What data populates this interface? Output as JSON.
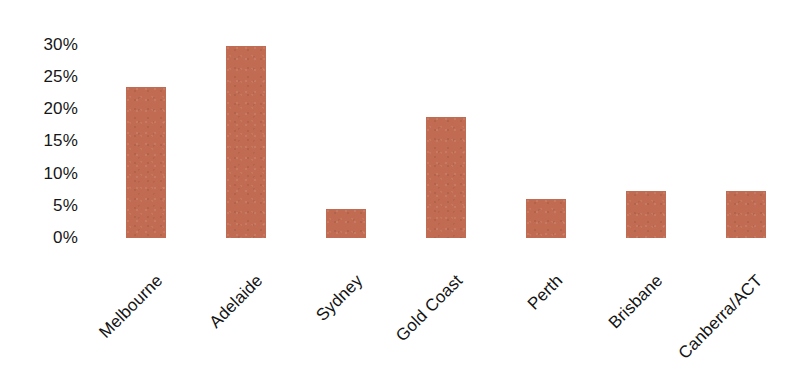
{
  "chart_data": {
    "type": "bar",
    "title": "",
    "subtitle": "",
    "xlabel": "",
    "ylabel": "",
    "categories": [
      "Melbourne",
      "Adelaide",
      "Sydney",
      "Gold Coast",
      "Perth",
      "Brisbane",
      "Canberra/ACT"
    ],
    "values": [
      23.5,
      29.8,
      4.5,
      18.8,
      6.1,
      7.3,
      7.3
    ],
    "value_unit": "%",
    "ylim": [
      0,
      30
    ],
    "y_tick_values": [
      30,
      25,
      20,
      15,
      10,
      5,
      0
    ],
    "y_tick_labels": [
      "30%",
      "25%",
      "20%",
      "15%",
      "10%",
      "5%",
      "0%"
    ],
    "grid": false,
    "axis_line": false,
    "legend": null,
    "legend_position": "none",
    "series": [
      {
        "name": "",
        "values": [
          23.5,
          29.8,
          4.5,
          18.8,
          6.1,
          7.3,
          7.3
        ]
      }
    ],
    "bar_color": "#c06b52",
    "background_color": "#ffffff",
    "label_rotation_degrees": -45
  }
}
